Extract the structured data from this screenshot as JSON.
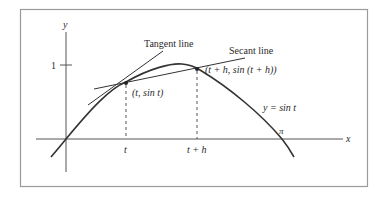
{
  "figure": {
    "frame": {
      "x": 20,
      "y": 9,
      "width": 348,
      "height": 178
    },
    "colors": {
      "frame": "#9a9a9a",
      "axis": "#555555",
      "curve": "#333333",
      "text": "#2a2a2a"
    },
    "axes": {
      "x_label": "x",
      "y_label": "y",
      "y_tick_label": "1",
      "pi_label": "π",
      "origin": {
        "x": 66,
        "y": 139
      }
    },
    "curve": {
      "label": "y = sin t",
      "function": "sin"
    },
    "points": {
      "p1": {
        "label": "(t, sin t)",
        "x_tick_label": "t",
        "x": 126,
        "y": 83
      },
      "p2": {
        "label": "(t + h, sin (t + h))",
        "x_tick_label": "t + h",
        "x": 197,
        "y": 69
      }
    },
    "lines": {
      "tangent": {
        "label": "Tangent line"
      },
      "secant": {
        "label": "Secant line"
      }
    }
  }
}
